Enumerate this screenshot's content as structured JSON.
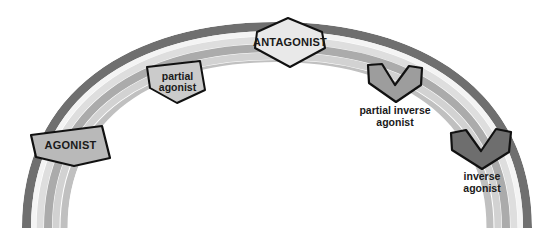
{
  "diagram": {
    "background_color": "#ffffff",
    "arc": {
      "name": "efficacy-spectrum-arc",
      "stripes": [
        {
          "name": "top-dark-stripe",
          "color": "#6f6f6f"
        },
        {
          "name": "highlight-stripe",
          "color": "#f2f2f2"
        },
        {
          "name": "upper-light-stripe",
          "color": "#dcdcdc"
        },
        {
          "name": "mid-gray-stripe",
          "color": "#a9a9a9"
        },
        {
          "name": "lower-light-stripe",
          "color": "#cfcfcf"
        },
        {
          "name": "bottom-pale-stripe",
          "color": "#bdbdbd"
        }
      ]
    },
    "markers": [
      {
        "id": "agonist",
        "label": "AGONIST",
        "shape": "pentagon-home-plate-down",
        "fill": "#b9b9b9",
        "stroke": "#111111",
        "label_style": "uppercase-bold"
      },
      {
        "id": "partial-agonist",
        "label_lines": [
          "partial",
          "agonist"
        ],
        "shape": "pentagon-home-plate-down",
        "fill": "#cbcbcb",
        "stroke": "#111111",
        "label_style": "lowercase-bold"
      },
      {
        "id": "antagonist",
        "label": "ANTAGONIST",
        "shape": "hexagon-vertical",
        "fill": "#e8e8e8",
        "stroke": "#111111",
        "label_style": "uppercase-bold"
      },
      {
        "id": "partial-inverse-agonist",
        "label_lines": [
          "partial inverse",
          "agonist"
        ],
        "shape": "chevron-down",
        "fill": "#9d9d9d",
        "stroke": "#111111",
        "label_style": "caption-below"
      },
      {
        "id": "inverse-agonist",
        "label_lines": [
          "inverse",
          "agonist"
        ],
        "shape": "chevron-down",
        "fill": "#6e6e6e",
        "stroke": "#111111",
        "label_style": "caption-below"
      }
    ]
  },
  "labels": {
    "agonist": "AGONIST",
    "partial_agonist_line1": "partial",
    "partial_agonist_line2": "agonist",
    "antagonist": "ANTAGONIST",
    "partial_inverse_agonist_line1": "partial inverse",
    "partial_inverse_agonist_line2": "agonist",
    "inverse_agonist_line1": "inverse",
    "inverse_agonist_line2": "agonist"
  }
}
